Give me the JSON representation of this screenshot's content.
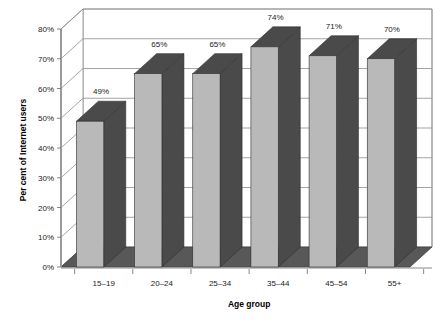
{
  "chart_data": {
    "type": "bar",
    "title": "",
    "subtitle": "",
    "xlabel": "Age group",
    "ylabel": "Per cent of Internet users",
    "categories": [
      "15–19",
      "20–24",
      "25–34",
      "35–44",
      "45–54",
      "55+"
    ],
    "values": [
      49,
      65,
      65,
      74,
      71,
      70
    ],
    "data_labels": [
      "49%",
      "65%",
      "65%",
      "74%",
      "71%",
      "70%"
    ],
    "ylim": [
      0,
      80
    ],
    "ytick_values": [
      0,
      10,
      20,
      30,
      40,
      50,
      60,
      70,
      80
    ],
    "ytick_labels": [
      "0%",
      "10%",
      "20%",
      "30%",
      "40%",
      "50%",
      "60%",
      "70%",
      "80%"
    ],
    "grid": true,
    "grid_axis": "y",
    "legend": false,
    "legend_position": "none",
    "three_d": true,
    "series": [
      {
        "name": "Per cent of Internet users",
        "values": [
          49,
          65,
          65,
          74,
          71,
          70
        ]
      }
    ]
  },
  "style": {
    "background": "#ffffff",
    "bar_front_color": "#b9b9b9",
    "bar_side_color": "#4a4a4a",
    "bar_top_color": "#4a4a4a",
    "floor_color": "#585858",
    "wall_color": "#ffffff",
    "grid_color": "#8d8d8d",
    "axis_color": "#9a9a9a",
    "text_color": "#1a1a1a"
  }
}
